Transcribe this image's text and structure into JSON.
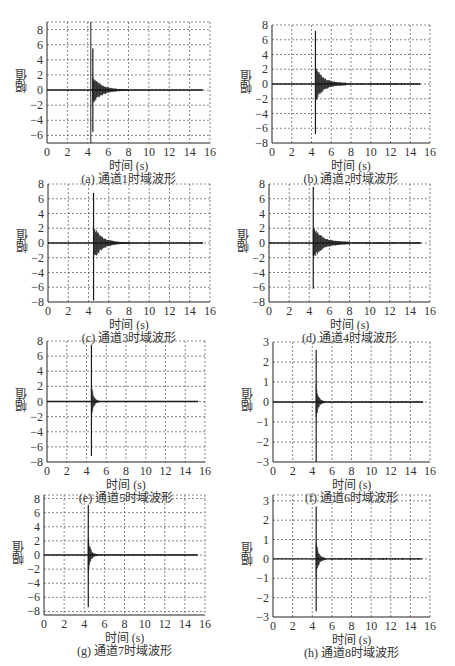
{
  "chart_data": [
    {
      "id": "a",
      "type": "line",
      "caption": "(a) 通道1时域波形",
      "title": "通道1时域波形",
      "xlabel": "时间 (s)",
      "ylabel": "幅值",
      "xlim": [
        0,
        16
      ],
      "ylim": [
        -7,
        9
      ],
      "xticks": [
        0,
        2,
        4,
        6,
        8,
        10,
        12,
        14,
        16
      ],
      "yticks": [
        -6,
        -4,
        -2,
        0,
        2,
        4,
        6,
        8
      ],
      "grid": true,
      "signal": {
        "onset": 4.5,
        "peak_pos": 5.5,
        "peak_neg": -5.5,
        "decay_end": 8.0,
        "end": 15.3,
        "baseline_noise": 0.05
      },
      "annotations": [
        {
          "type": "vline",
          "x": 4.3
        }
      ],
      "box": {
        "left": 47,
        "top": 22,
        "right": 210,
        "bottom": 143
      }
    },
    {
      "id": "b",
      "type": "line",
      "caption": "(b) 通道2时域波形",
      "title": "通道2时域波形",
      "xlabel": "时间 (s)",
      "ylabel": "幅值",
      "xlim": [
        0,
        16
      ],
      "ylim": [
        -8,
        8
      ],
      "xticks": [
        0,
        2,
        4,
        6,
        8,
        10,
        12,
        14,
        16
      ],
      "yticks": [
        -8,
        -6,
        -4,
        -2,
        0,
        2,
        4,
        6,
        8
      ],
      "grid": true,
      "signal": {
        "onset": 4.4,
        "peak_pos": 7.2,
        "peak_neg": -6.8,
        "decay_end": 7.5,
        "end": 15.0,
        "baseline_noise": 0.15
      },
      "box": {
        "left": 272,
        "top": 25,
        "right": 430,
        "bottom": 143
      }
    },
    {
      "id": "c",
      "type": "line",
      "caption": "(c) 通道3时域波形",
      "title": "通道3时域波形",
      "xlabel": "时间 (s)",
      "ylabel": "幅值",
      "xlim": [
        0,
        16
      ],
      "ylim": [
        -8,
        8
      ],
      "xticks": [
        0,
        2,
        4,
        6,
        8,
        10,
        12,
        14,
        16
      ],
      "yticks": [
        -8,
        -6,
        -4,
        -2,
        0,
        2,
        4,
        6,
        8
      ],
      "grid": true,
      "signal": {
        "onset": 4.5,
        "peak_pos": 6.8,
        "peak_neg": -7.8,
        "decay_end": 8.0,
        "end": 15.3,
        "baseline_noise": 0.05
      },
      "box": {
        "left": 48,
        "top": 184,
        "right": 210,
        "bottom": 302
      }
    },
    {
      "id": "d",
      "type": "line",
      "caption": "(d) 通道4时域波形",
      "title": "通道4时域波形",
      "xlabel": "时间 (s)",
      "ylabel": "幅值",
      "xlim": [
        0,
        16
      ],
      "ylim": [
        -8,
        8
      ],
      "xticks": [
        0,
        2,
        4,
        6,
        8,
        10,
        12,
        14,
        16
      ],
      "yticks": [
        -8,
        -6,
        -4,
        -2,
        0,
        2,
        4,
        6,
        8
      ],
      "grid": true,
      "signal": {
        "onset": 4.4,
        "peak_pos": 7.6,
        "peak_neg": -6.2,
        "decay_end": 8.0,
        "end": 15.1,
        "baseline_noise": 0.15
      },
      "box": {
        "left": 269,
        "top": 184,
        "right": 430,
        "bottom": 302
      }
    },
    {
      "id": "e",
      "type": "line",
      "caption": "(e) 通道5时域波形",
      "title": "通道5时域波形",
      "xlabel": "时间 (s)",
      "ylabel": "幅值",
      "xlim": [
        0,
        16
      ],
      "ylim": [
        -8,
        8
      ],
      "xticks": [
        0,
        2,
        4,
        6,
        8,
        10,
        12,
        14,
        16
      ],
      "yticks": [
        -8,
        -6,
        -4,
        -2,
        0,
        2,
        4,
        6,
        8
      ],
      "grid": true,
      "signal": {
        "onset": 4.5,
        "peak_pos": 7.5,
        "peak_neg": -7.2,
        "decay_end": 5.3,
        "end": 15.3,
        "baseline_noise": 0.05
      },
      "box": {
        "left": 47,
        "top": 341,
        "right": 205,
        "bottom": 462
      }
    },
    {
      "id": "f",
      "type": "line",
      "caption": "(f) 通道6时域波形",
      "title": "通道6时域波形",
      "xlabel": "时间 (s)",
      "ylabel": "幅值",
      "xlim": [
        0,
        16
      ],
      "ylim": [
        -3,
        3
      ],
      "xticks": [
        0,
        2,
        4,
        6,
        8,
        10,
        12,
        14,
        16
      ],
      "yticks": [
        -3,
        -2,
        -1,
        0,
        1,
        2,
        3
      ],
      "grid": true,
      "signal": {
        "onset": 4.4,
        "peak_pos": 2.6,
        "peak_neg": -3.0,
        "decay_end": 5.3,
        "end": 15.3,
        "baseline_noise": 0.03
      },
      "box": {
        "left": 273,
        "top": 342,
        "right": 430,
        "bottom": 462
      }
    },
    {
      "id": "g",
      "type": "line",
      "caption": "(g) 通道7时域波形",
      "title": "通道7时域波形",
      "xlabel": "时间 (s)",
      "ylabel": "幅值",
      "xlim": [
        0,
        16
      ],
      "ylim": [
        -8.5,
        8.5
      ],
      "xticks": [
        0,
        2,
        4,
        6,
        8,
        10,
        12,
        14,
        16
      ],
      "yticks": [
        -8,
        -6,
        -4,
        -2,
        0,
        2,
        4,
        6,
        8
      ],
      "grid": true,
      "signal": {
        "onset": 4.4,
        "peak_pos": 7.1,
        "peak_neg": -7.4,
        "decay_end": 5.3,
        "end": 15.3,
        "baseline_noise": 0.08
      },
      "box": {
        "left": 44,
        "top": 495,
        "right": 205,
        "bottom": 615
      }
    },
    {
      "id": "h",
      "type": "line",
      "caption": "(h) 通道8时域波形",
      "title": "通道8时域波形",
      "xlabel": "时间 (s)",
      "ylabel": "幅值",
      "xlim": [
        0,
        16
      ],
      "ylim": [
        -3,
        3.3
      ],
      "xticks": [
        0,
        2,
        4,
        6,
        8,
        10,
        12,
        14,
        16
      ],
      "yticks": [
        -3,
        -2,
        -1,
        0,
        1,
        2,
        3
      ],
      "grid": true,
      "signal": {
        "onset": 4.4,
        "peak_pos": 2.7,
        "peak_neg": -2.7,
        "decay_end": 5.3,
        "end": 15.2,
        "baseline_noise": 0.06
      },
      "box": {
        "left": 273,
        "top": 495,
        "right": 430,
        "bottom": 617
      }
    }
  ]
}
